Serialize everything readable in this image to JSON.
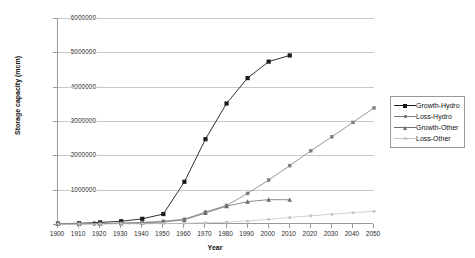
{
  "chart_data": {
    "type": "line",
    "title": "",
    "xlabel": "Year",
    "ylabel": "Storage capacity (mcm)",
    "xlim": [
      1900,
      2050
    ],
    "ylim": [
      0,
      6000000
    ],
    "grid": true,
    "legend_position": "right",
    "x_ticks": [
      1900,
      1910,
      1920,
      1930,
      1940,
      1950,
      1960,
      1970,
      1980,
      1990,
      2000,
      2010,
      2020,
      2030,
      2040,
      2050
    ],
    "y_ticks": [
      0,
      1000000,
      2000000,
      3000000,
      4000000,
      5000000,
      6000000
    ],
    "y_tick_labels": [
      "0",
      "1000000",
      "2000000",
      "3000000",
      "4000000",
      "5000000",
      "6000000"
    ],
    "series": [
      {
        "name": "Growth-Hydro",
        "marker": "filled-square",
        "color": "#1a1a1a",
        "x": [
          1900,
          1910,
          1920,
          1930,
          1940,
          1950,
          1960,
          1970,
          1980,
          1990,
          2000,
          2010
        ],
        "values": [
          10000,
          20000,
          45000,
          80000,
          150000,
          290000,
          1230000,
          2470000,
          3510000,
          4250000,
          4730000,
          4910000
        ]
      },
      {
        "name": "Loss-Hydro",
        "marker": "square",
        "color": "#7d7d7d",
        "x": [
          1900,
          1910,
          1920,
          1930,
          1940,
          1950,
          1960,
          1970,
          1980,
          1990,
          2000,
          2010,
          2020,
          2030,
          2040,
          2050
        ],
        "values": [
          2000,
          5000,
          12000,
          25000,
          45000,
          80000,
          140000,
          350000,
          540000,
          890000,
          1280000,
          1700000,
          2130000,
          2540000,
          2960000,
          3380000
        ]
      },
      {
        "name": "Growth-Other",
        "marker": "triangle",
        "color": "#6e6e6e",
        "x": [
          1900,
          1910,
          1920,
          1930,
          1940,
          1950,
          1960,
          1970,
          1980,
          1990,
          2000,
          2010
        ],
        "values": [
          1000,
          3000,
          8000,
          18000,
          35000,
          60000,
          120000,
          320000,
          520000,
          650000,
          710000,
          705000
        ]
      },
      {
        "name": "Loss-Other",
        "marker": "dot",
        "color": "#c4c4c4",
        "x": [
          1900,
          1910,
          1920,
          1930,
          1940,
          1950,
          1960,
          1970,
          1980,
          1990,
          2000,
          2010,
          2020,
          2030,
          2040,
          2050
        ],
        "values": [
          500,
          1000,
          2000,
          4000,
          7000,
          12000,
          20000,
          35000,
          55000,
          90000,
          135000,
          190000,
          240000,
          285000,
          330000,
          370000
        ]
      }
    ]
  }
}
